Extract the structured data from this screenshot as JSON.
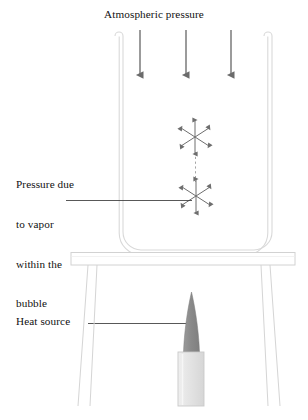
{
  "figure": {
    "title": "Atmospheric pressure",
    "width": 308,
    "height": 420,
    "background": "#ffffff"
  },
  "labels": {
    "atmospheric_pressure": "Atmospheric pressure",
    "vapor_pressure_line1": "Pressure due",
    "vapor_pressure_line2": "to vapor",
    "vapor_pressure_line3": "within the",
    "vapor_pressure_line4": "bubble",
    "heat_source": "Heat source"
  },
  "colors": {
    "arrow_gray": "#6b6b6b",
    "bubble_arrow_gray": "#6e6e6e",
    "leader_line": "#3a3a3a",
    "tube_outline": "#d8d8d8",
    "table_outline": "#d5d5d5",
    "flame_gray": "#8e8e8e",
    "burner_body": "#e4e4e4",
    "burner_edge": "#c9c9c9",
    "text": "#111111"
  },
  "elements": {
    "atmospheric_arrows": {
      "count": 3,
      "direction": "down",
      "x_positions": [
        140,
        186,
        231
      ],
      "y_start": 30,
      "y_end": 82
    },
    "u_tube": {
      "left_tube_x": 119,
      "right_tube_x": 268,
      "top_y": 32,
      "bottom_y": 250,
      "tube_width": 8
    },
    "bubbles": [
      {
        "name": "upper-bubble",
        "cx": 195,
        "cy": 137,
        "arrows": 6,
        "radius": 20
      },
      {
        "name": "lower-bubble",
        "cx": 196,
        "cy": 196,
        "arrows": 6,
        "radius": 20
      }
    ],
    "bubble_path": {
      "style": "dashed",
      "from_y": 157,
      "to_y": 176
    },
    "table": {
      "top_y": 252,
      "top_height": 13,
      "left_x": 71,
      "right_x": 295,
      "legs": 2
    },
    "burner": {
      "flame_tip_y": 293,
      "flame_base_y": 352,
      "body_top_y": 352,
      "body_bottom_y": 406,
      "body_left_x": 178,
      "body_right_x": 204
    },
    "leader_lines": [
      {
        "name": "vapor-leader",
        "x1": 66,
        "y1": 200,
        "x2": 192,
        "y2": 200
      },
      {
        "name": "heat-leader",
        "x1": 88,
        "y1": 323,
        "x2": 192,
        "y2": 323
      }
    ]
  }
}
